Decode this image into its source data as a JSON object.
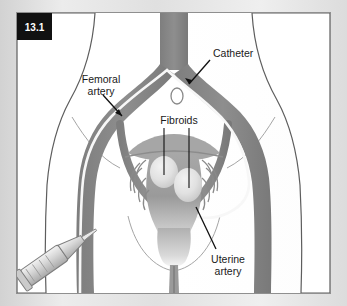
{
  "figure": {
    "badge": "13.1",
    "type": "medical-illustration",
    "orientation": "anterior view of female pelvis"
  },
  "labels": [
    {
      "id": "catheter",
      "text": "Catheter",
      "lines": [
        "Catheter"
      ],
      "x": 213,
      "y": 54,
      "anchor": "start"
    },
    {
      "id": "femoral-artery",
      "text": "Femoral artery",
      "lines": [
        "Femoral",
        "artery"
      ],
      "x": 101,
      "y": 82,
      "anchor": "middle"
    },
    {
      "id": "fibroids",
      "text": "Fibroids",
      "lines": [
        "Fibroids"
      ],
      "x": 183,
      "y": 122,
      "anchor": "middle"
    },
    {
      "id": "uterine-artery",
      "text": "Uterine artery",
      "lines": [
        "Uterine",
        "artery"
      ],
      "x": 228,
      "y": 261,
      "anchor": "middle"
    }
  ],
  "label_text": {
    "catheter": "Catheter",
    "femoral_line1": "Femoral",
    "femoral_line2": "artery",
    "fibroids": "Fibroids",
    "uterine_line1": "Uterine",
    "uterine_line2": "artery"
  },
  "anatomy": [
    {
      "name": "aorta",
      "description": "descending aorta entering from top center"
    },
    {
      "name": "iliac-arteries",
      "description": "common iliac bifurcation"
    },
    {
      "name": "femoral-arteries",
      "description": "left and right femoral arteries running down the thighs"
    },
    {
      "name": "uterus",
      "description": "uterus with fundus and cervix"
    },
    {
      "name": "fallopian-tubes",
      "description": "fallopian tubes and broad ligament"
    },
    {
      "name": "fibroid-left",
      "description": "pale rounded fibroid, left"
    },
    {
      "name": "fibroid-right",
      "description": "pale rounded fibroid, right"
    },
    {
      "name": "bladder",
      "description": "small outlined structure above uterus"
    },
    {
      "name": "vagina",
      "description": "vaginal canal below cervix"
    },
    {
      "name": "syringe",
      "description": "syringe / introducer at femoral puncture site, lower left"
    },
    {
      "name": "body-silhouette",
      "description": "torso and thigh outline"
    }
  ],
  "colors": {
    "vessel": "#8a8a8a",
    "vessel_dark": "#6f6f6f",
    "catheter_line": "#f6f6f6",
    "organ": "#9e9e9e",
    "organ_light": "#b9b9b9",
    "fibroid": "#e2e2e2",
    "background": "#ffffff",
    "page_background": "#e3e3e3",
    "frame": "#8f8f8f",
    "badge_background": "#111111",
    "badge_text": "#ffffff",
    "label_text": "#1a1a1a",
    "leader": "#111111",
    "outline": "#9a9a9a"
  }
}
